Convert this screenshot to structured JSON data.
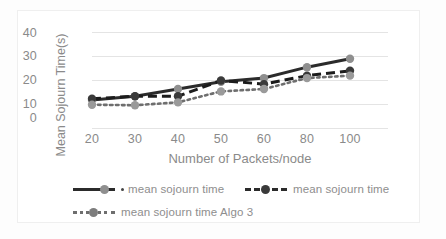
{
  "chart_data": {
    "type": "line",
    "title": "",
    "subtitle": "",
    "xlabel": "Number of Packets/node",
    "ylabel": "Mean Sojourn Time(s)",
    "categories": [
      "20",
      "30",
      "40",
      "50",
      "60",
      "80",
      "100"
    ],
    "ylim": [
      0,
      40
    ],
    "yticks": [
      "0",
      "10",
      "20",
      "30",
      "40"
    ],
    "grid": "horizontal",
    "legend_position": "bottom",
    "series": [
      {
        "name": "mean sojourn time",
        "style": "solid",
        "marker": "circle",
        "color": "#2b2b2b",
        "marker_color": "#8f8f8f",
        "values": [
          12,
          13.5,
          16.5,
          19.5,
          21,
          25.5,
          29
        ]
      },
      {
        "name": "mean sojourn time",
        "style": "dashed",
        "marker": "circle",
        "color": "#1c1c1c",
        "marker_color": "#3a3a3a",
        "values": [
          12.5,
          13.5,
          13.5,
          20,
          18.5,
          22,
          24
        ]
      },
      {
        "name": "mean sojourn time Algo 3",
        "style": "dotted",
        "marker": "circle",
        "color": "#6e6e6e",
        "marker_color": "#9a9a9a",
        "values": [
          10,
          9.8,
          11,
          15.5,
          16.5,
          21,
          22
        ]
      }
    ]
  },
  "axes": {
    "y_ticks": [
      {
        "label": "40"
      },
      {
        "label": "30"
      },
      {
        "label": "20"
      },
      {
        "label": "10"
      },
      {
        "label": "0"
      }
    ],
    "x_ticks": [
      {
        "label": "20"
      },
      {
        "label": "30"
      },
      {
        "label": "40"
      },
      {
        "label": "50"
      },
      {
        "label": "60"
      },
      {
        "label": "80"
      },
      {
        "label": "100"
      }
    ],
    "x_title": "Number of Packets/node",
    "y_title": "Mean Sojourn Time(s)"
  },
  "legend": {
    "row1": [
      {
        "label": "mean sojourn time",
        "style": "solid",
        "has_dot_prefix": true
      },
      {
        "label": "mean sojourn time",
        "style": "dashed",
        "has_dot_prefix": false
      }
    ],
    "row2": [
      {
        "label": "mean sojourn time Algo 3",
        "style": "dotted",
        "has_dot_prefix": false
      }
    ]
  },
  "colors": {
    "grid": "#e4e4e4",
    "text": "#8a8a8a",
    "series_solid": "#2b2b2b",
    "series_dashed": "#1c1c1c",
    "series_dotted": "#6e6e6e",
    "marker_gray": "#8f8f8f",
    "frame": "#efefef",
    "background": "#ffffff"
  }
}
